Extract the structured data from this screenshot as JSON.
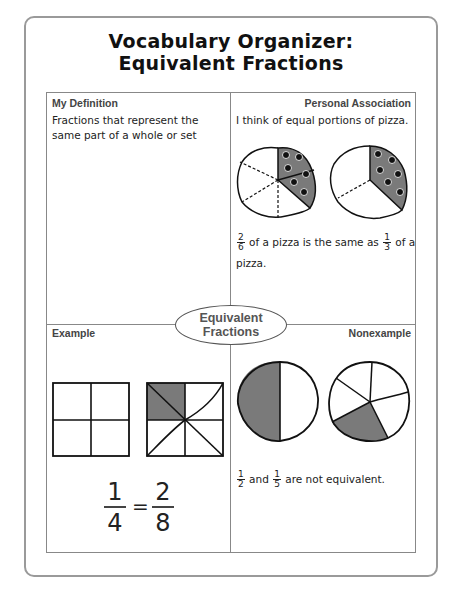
{
  "title": {
    "line1": "Vocabulary Organizer:",
    "line2": "Equivalent Fractions"
  },
  "center_oval": {
    "line1": "Equivalent",
    "line2": "Fractions"
  },
  "quadrants": {
    "definition": {
      "label": "My Definition",
      "text": "Fractions that represent the same part of a whole or set"
    },
    "association": {
      "label": "Personal Association",
      "text": "I think of equal portions of pizza.",
      "fraction_a": {
        "num": "2",
        "den": "6"
      },
      "mid_text": "of a pizza is the same as",
      "fraction_b": {
        "num": "1",
        "den": "3"
      },
      "end_text": "of a",
      "end_text2": "pizza."
    },
    "example": {
      "label": "Example",
      "fraction_left": {
        "num": "1",
        "den": "4"
      },
      "equals": "=",
      "fraction_right": {
        "num": "2",
        "den": "8"
      }
    },
    "nonexample": {
      "label": "Nonexample",
      "fraction_a": {
        "num": "1",
        "den": "2"
      },
      "and_text": "and",
      "fraction_b": {
        "num": "1",
        "den": "5"
      },
      "end_text": "are not equivalent."
    }
  },
  "colors": {
    "shade": "#7a7a7a",
    "border": "#888888",
    "frame": "#9a9a9a"
  }
}
